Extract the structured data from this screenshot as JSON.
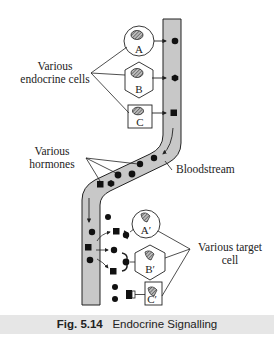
{
  "labels": {
    "endocrine_cells": [
      "Various",
      "endocrine cells"
    ],
    "hormones": [
      "Various",
      "hormones"
    ],
    "bloodstream": "Bloodstream",
    "target_cells": [
      "Various target",
      "cell"
    ]
  },
  "endocrine_cells": [
    {
      "id": "A",
      "shape": "circle"
    },
    {
      "id": "B",
      "shape": "hexagon"
    },
    {
      "id": "C",
      "shape": "square"
    }
  ],
  "target_cells": [
    {
      "id": "A′",
      "shape": "circle"
    },
    {
      "id": "B′",
      "shape": "hexagon"
    },
    {
      "id": "C′",
      "shape": "square"
    }
  ],
  "caption": {
    "figure_number": "Fig. 5.14",
    "title": "Endocrine Signalling"
  },
  "colors": {
    "vessel_fill": "#c8c8c8",
    "outline": "#222222",
    "caption_band": "#e6e6e6"
  }
}
